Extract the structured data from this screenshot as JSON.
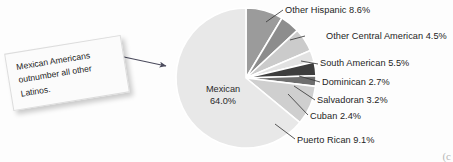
{
  "figure": {
    "background_color": "#fdfdfd",
    "callout": {
      "text": "Mexican Americans outnumber all other Latinos.",
      "name": "callout-note"
    },
    "corner_mark": "(c"
  },
  "chart_data": {
    "type": "pie",
    "title": "",
    "subtitle": "",
    "xlabel": "",
    "ylabel": "",
    "legend_position": "none",
    "grid": false,
    "units": "percent",
    "categories": [
      "Mexican",
      "Other Hispanic",
      "Other Central American",
      "South American",
      "Dominican",
      "Salvadoran",
      "Cuban",
      "Puerto Rican"
    ],
    "values": [
      64.0,
      8.6,
      4.5,
      5.5,
      2.7,
      3.2,
      2.4,
      9.1
    ],
    "slices": [
      {
        "label": "Other Hispanic",
        "value": 8.6,
        "value_text": "8.6%",
        "full_label": "Other Hispanic 8.6%",
        "color": "#9b9b9b"
      },
      {
        "label": "Other Central American",
        "value": 4.5,
        "value_text": "4.5%",
        "full_label": "Other Central American 4.5%",
        "color": "#8d8d8d"
      },
      {
        "label": "South American",
        "value": 5.5,
        "value_text": "5.5%",
        "full_label": "South American 5.5%",
        "color": "#cbcbcb"
      },
      {
        "label": "Dominican",
        "value": 2.7,
        "value_text": "2.7%",
        "full_label": "Dominican 2.7%",
        "color": "#e2e2e2"
      },
      {
        "label": "Salvadoran",
        "value": 3.2,
        "value_text": "3.2%",
        "full_label": "Salvadoran 3.2%",
        "color": "#3d3d3d"
      },
      {
        "label": "Cuban",
        "value": 2.4,
        "value_text": "2.4%",
        "full_label": "Cuban 2.4%",
        "color": "#6e6e6e"
      },
      {
        "label": "Puerto Rican",
        "value": 9.1,
        "value_text": "9.1%",
        "full_label": "Puerto Rican 9.1%",
        "color": "#cfcfcf"
      },
      {
        "label": "Mexican",
        "value": 64.0,
        "value_text": "64.0%",
        "full_label": "Mexican 64.0%",
        "color": "#e8e8e8"
      }
    ],
    "center_label": {
      "name": "Mexican",
      "percent": "64.0%"
    }
  }
}
